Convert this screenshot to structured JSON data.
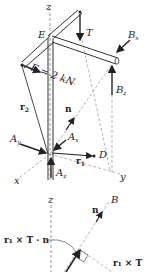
{
  "figure": {
    "top_diagram": {
      "labels": {
        "z_axis": "z",
        "x_axis": "x",
        "y_axis": "y",
        "E": "E",
        "T": "T",
        "Bx": "B",
        "Bx_sub": "x",
        "Bz": "B",
        "Bz_sub": "z",
        "F": "F = 2 kN",
        "r2": "r",
        "r2_sub": "2",
        "n": "n",
        "Ay": "A",
        "Ay_sub": "y",
        "Ax": "A",
        "Ax_sub": "x",
        "Az": "A",
        "Az_sub": "z",
        "r1": "r",
        "r1_sub": "1",
        "D": "D"
      }
    },
    "bottom_diagram": {
      "labels": {
        "z_axis": "z",
        "B": "B",
        "n": "n",
        "r1xTn": "r₁ × T · n",
        "r1xT": "r₁ × T"
      }
    }
  }
}
